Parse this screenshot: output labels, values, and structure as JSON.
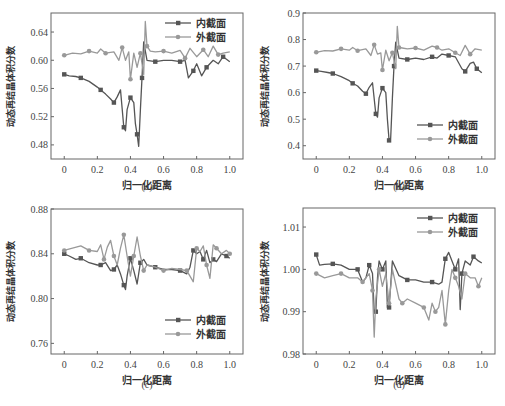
{
  "figure": {
    "series_names": [
      "内截面",
      "外截面"
    ],
    "colors": {
      "inner": "#555555",
      "outer": "#999999"
    }
  },
  "chart_data": [
    {
      "id": "a",
      "caption": "(a)",
      "type": "line",
      "xlabel": "归一化距离",
      "ylabel": "动态再结晶体积分数",
      "xlim": [
        -0.08,
        1.08
      ],
      "ylim": [
        0.46,
        0.667
      ],
      "xticks": [
        "0",
        "0.2",
        "0.4",
        "0.6",
        "0.8",
        "1.0"
      ],
      "yticks": [
        "0.48",
        "0.52",
        "0.56",
        "0.60",
        "0.64"
      ],
      "ytick_values": [
        0.48,
        0.52,
        0.56,
        0.6,
        0.64
      ],
      "legend_position": "upper right",
      "series": [
        {
          "name": "内截面",
          "x": [
            0,
            0.03,
            0.07,
            0.1,
            0.15,
            0.2,
            0.22,
            0.25,
            0.28,
            0.3,
            0.32,
            0.34,
            0.36,
            0.37,
            0.38,
            0.4,
            0.42,
            0.43,
            0.44,
            0.45,
            0.46,
            0.47,
            0.48,
            0.5,
            0.55,
            0.6,
            0.65,
            0.7,
            0.73,
            0.75,
            0.78,
            0.8,
            0.83,
            0.86,
            0.9,
            0.93,
            0.96,
            1.0
          ],
          "values": [
            0.58,
            0.578,
            0.577,
            0.575,
            0.57,
            0.562,
            0.558,
            0.552,
            0.545,
            0.54,
            0.548,
            0.558,
            0.505,
            0.5,
            0.53,
            0.547,
            0.54,
            0.51,
            0.495,
            0.478,
            0.53,
            0.575,
            0.626,
            0.6,
            0.598,
            0.6,
            0.6,
            0.598,
            0.6,
            0.575,
            0.585,
            0.595,
            0.578,
            0.59,
            0.6,
            0.595,
            0.605,
            0.598
          ]
        },
        {
          "name": "外截面",
          "x": [
            0,
            0.05,
            0.1,
            0.15,
            0.2,
            0.22,
            0.25,
            0.3,
            0.33,
            0.35,
            0.37,
            0.39,
            0.4,
            0.42,
            0.44,
            0.46,
            0.48,
            0.49,
            0.5,
            0.52,
            0.55,
            0.6,
            0.65,
            0.7,
            0.73,
            0.76,
            0.8,
            0.84,
            0.87,
            0.9,
            0.93,
            0.96,
            1.0
          ],
          "values": [
            0.607,
            0.61,
            0.609,
            0.613,
            0.61,
            0.616,
            0.61,
            0.612,
            0.6,
            0.618,
            0.6,
            0.612,
            0.573,
            0.61,
            0.59,
            0.61,
            0.58,
            0.655,
            0.62,
            0.613,
            0.612,
            0.613,
            0.61,
            0.614,
            0.603,
            0.617,
            0.605,
            0.615,
            0.605,
            0.62,
            0.608,
            0.61,
            0.612
          ]
        }
      ]
    },
    {
      "id": "b",
      "caption": "(b)",
      "type": "line",
      "xlabel": "归一化距离",
      "ylabel": "动态再结晶体积分数",
      "xlim": [
        -0.08,
        1.08
      ],
      "ylim": [
        0.35,
        0.9
      ],
      "xticks": [
        "0",
        "0.2",
        "0.4",
        "0.6",
        "0.8",
        "1.0"
      ],
      "yticks": [
        "0.4",
        "0.5",
        "0.6",
        "0.7",
        "0.8",
        "0.9"
      ],
      "ytick_values": [
        0.4,
        0.5,
        0.6,
        0.7,
        0.8,
        0.9
      ],
      "legend_position": "lower right",
      "series": [
        {
          "name": "内截面",
          "x": [
            0,
            0.03,
            0.07,
            0.1,
            0.15,
            0.2,
            0.22,
            0.25,
            0.28,
            0.3,
            0.32,
            0.34,
            0.36,
            0.37,
            0.38,
            0.4,
            0.42,
            0.43,
            0.44,
            0.45,
            0.46,
            0.47,
            0.48,
            0.5,
            0.55,
            0.6,
            0.65,
            0.7,
            0.73,
            0.76,
            0.8,
            0.84,
            0.88,
            0.9,
            0.93,
            0.95,
            0.97,
            1.0
          ],
          "values": [
            0.683,
            0.68,
            0.676,
            0.672,
            0.66,
            0.645,
            0.635,
            0.625,
            0.605,
            0.596,
            0.62,
            0.637,
            0.52,
            0.508,
            0.58,
            0.617,
            0.6,
            0.5,
            0.42,
            0.43,
            0.58,
            0.7,
            0.79,
            0.73,
            0.725,
            0.73,
            0.725,
            0.735,
            0.73,
            0.745,
            0.74,
            0.735,
            0.69,
            0.68,
            0.71,
            0.715,
            0.69,
            0.675
          ]
        },
        {
          "name": "外截面",
          "x": [
            0,
            0.05,
            0.1,
            0.15,
            0.2,
            0.22,
            0.25,
            0.3,
            0.33,
            0.35,
            0.37,
            0.39,
            0.4,
            0.42,
            0.44,
            0.46,
            0.48,
            0.49,
            0.5,
            0.52,
            0.55,
            0.6,
            0.65,
            0.7,
            0.73,
            0.76,
            0.8,
            0.84,
            0.87,
            0.9,
            0.93,
            0.96,
            1.0
          ],
          "values": [
            0.752,
            0.758,
            0.757,
            0.765,
            0.76,
            0.77,
            0.758,
            0.765,
            0.74,
            0.78,
            0.745,
            0.75,
            0.685,
            0.76,
            0.72,
            0.75,
            0.69,
            0.85,
            0.77,
            0.768,
            0.765,
            0.768,
            0.76,
            0.775,
            0.77,
            0.76,
            0.765,
            0.75,
            0.74,
            0.778,
            0.745,
            0.765,
            0.76
          ]
        }
      ]
    },
    {
      "id": "c",
      "caption": "(c)",
      "type": "line",
      "xlabel": "归一化距离",
      "ylabel": "动态再结晶体积分数",
      "xlim": [
        -0.08,
        1.08
      ],
      "ylim": [
        0.7505,
        0.88
      ],
      "xticks": [
        "0",
        "0.2",
        "0.4",
        "0.6",
        "0.8",
        "1.0"
      ],
      "yticks": [
        "0.76",
        "0.80",
        "0.84",
        "0.88"
      ],
      "ytick_values": [
        0.76,
        0.8,
        0.84,
        0.88
      ],
      "legend_position": "lower right",
      "series": [
        {
          "name": "内截面",
          "x": [
            0,
            0.03,
            0.07,
            0.1,
            0.15,
            0.2,
            0.22,
            0.25,
            0.28,
            0.3,
            0.32,
            0.34,
            0.36,
            0.37,
            0.38,
            0.4,
            0.42,
            0.44,
            0.46,
            0.48,
            0.5,
            0.55,
            0.6,
            0.65,
            0.7,
            0.74,
            0.76,
            0.78,
            0.8,
            0.82,
            0.84,
            0.86,
            0.88,
            0.9,
            0.92,
            0.95,
            0.98,
            1.0
          ],
          "values": [
            0.84,
            0.838,
            0.835,
            0.836,
            0.832,
            0.83,
            0.83,
            0.832,
            0.825,
            0.826,
            0.83,
            0.822,
            0.812,
            0.808,
            0.82,
            0.836,
            0.825,
            0.813,
            0.832,
            0.835,
            0.83,
            0.828,
            0.826,
            0.826,
            0.825,
            0.822,
            0.828,
            0.843,
            0.84,
            0.842,
            0.835,
            0.843,
            0.832,
            0.835,
            0.833,
            0.84,
            0.838,
            0.836
          ]
        },
        {
          "name": "外截面",
          "x": [
            0,
            0.05,
            0.1,
            0.15,
            0.2,
            0.22,
            0.24,
            0.26,
            0.28,
            0.3,
            0.32,
            0.34,
            0.36,
            0.38,
            0.4,
            0.42,
            0.44,
            0.46,
            0.48,
            0.5,
            0.55,
            0.6,
            0.65,
            0.7,
            0.74,
            0.76,
            0.78,
            0.8,
            0.82,
            0.84,
            0.86,
            0.88,
            0.9,
            0.92,
            0.95,
            0.98,
            1.0
          ],
          "values": [
            0.843,
            0.845,
            0.847,
            0.843,
            0.842,
            0.848,
            0.835,
            0.846,
            0.852,
            0.838,
            0.83,
            0.845,
            0.857,
            0.838,
            0.82,
            0.838,
            0.855,
            0.838,
            0.825,
            0.83,
            0.828,
            0.825,
            0.827,
            0.826,
            0.825,
            0.82,
            0.815,
            0.845,
            0.842,
            0.847,
            0.83,
            0.818,
            0.848,
            0.845,
            0.84,
            0.843,
            0.84
          ]
        }
      ]
    },
    {
      "id": "d",
      "caption": "(d)",
      "type": "line",
      "xlabel": "归一化距离",
      "ylabel": "动态再结晶体积分数",
      "xlim": [
        -0.08,
        1.08
      ],
      "ylim": [
        0.98,
        1.0145
      ],
      "xticks": [
        "0",
        "0.2",
        "0.4",
        "0.6",
        "0.8",
        "1.0"
      ],
      "yticks": [
        "0.98",
        "0.99",
        "1.00",
        "1.01"
      ],
      "ytick_values": [
        0.98,
        0.99,
        1.0,
        1.01
      ],
      "legend_position": "upper right",
      "series": [
        {
          "name": "内截面",
          "x": [
            0,
            0.02,
            0.05,
            0.1,
            0.15,
            0.2,
            0.25,
            0.28,
            0.3,
            0.32,
            0.34,
            0.35,
            0.36,
            0.37,
            0.38,
            0.4,
            0.42,
            0.43,
            0.44,
            0.46,
            0.5,
            0.55,
            0.6,
            0.65,
            0.7,
            0.74,
            0.76,
            0.78,
            0.8,
            0.82,
            0.84,
            0.86,
            0.87,
            0.88,
            0.9,
            0.93,
            0.95,
            0.98,
            1.0
          ],
          "values": [
            1.0035,
            1.001,
            1.0012,
            1.0013,
            1.001,
            1.0,
            1.0,
            0.997,
            0.998,
            1.001,
            0.999,
            0.99,
            0.99,
            0.998,
            1.002,
            1.0,
            1.002,
            0.991,
            0.991,
            1.002,
            0.9985,
            0.9975,
            0.9975,
            0.997,
            0.997,
            0.9965,
            0.997,
            1.0025,
            1.004,
            1.002,
            1.0,
            1.0025,
            0.9905,
            0.999,
            1.002,
            1.001,
            1.003,
            1.002,
            1.0015
          ]
        },
        {
          "name": "外截面",
          "x": [
            0,
            0.05,
            0.1,
            0.15,
            0.2,
            0.25,
            0.28,
            0.3,
            0.32,
            0.34,
            0.35,
            0.36,
            0.38,
            0.4,
            0.42,
            0.44,
            0.46,
            0.5,
            0.52,
            0.55,
            0.6,
            0.65,
            0.68,
            0.7,
            0.72,
            0.74,
            0.76,
            0.78,
            0.8,
            0.82,
            0.84,
            0.86,
            0.88,
            0.9,
            0.93,
            0.96,
            0.98,
            1.0
          ],
          "values": [
            0.999,
            0.998,
            0.9985,
            0.999,
            0.998,
            0.998,
            0.997,
            0.998,
            0.999,
            0.995,
            0.984,
            0.993,
            1.0,
            0.996,
            0.999,
            0.992,
            1.0,
            0.993,
            0.992,
            0.993,
            0.992,
            0.991,
            0.988,
            0.992,
            0.99,
            0.991,
            0.995,
            0.987,
            0.995,
            1.0,
            0.998,
            0.996,
            0.993,
            0.999,
            0.998,
            0.998,
            0.996,
            0.998
          ]
        }
      ]
    }
  ]
}
